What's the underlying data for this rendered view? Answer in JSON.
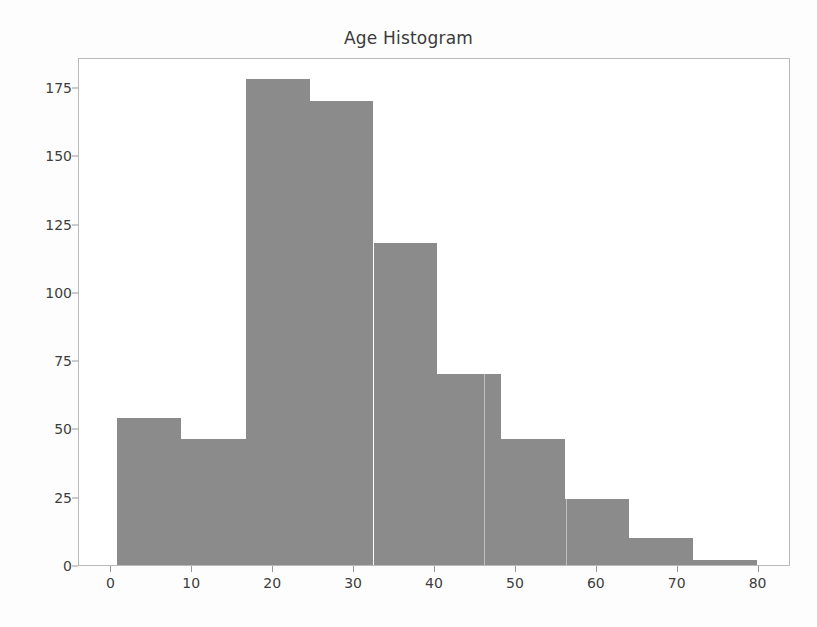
{
  "chart_data": {
    "type": "bar",
    "title": "Age Histogram",
    "xlabel": "",
    "ylabel": "",
    "grid": false,
    "legend": null,
    "xlim": [
      -4,
      84
    ],
    "ylim": [
      0,
      186
    ],
    "xticks": [
      0,
      10,
      20,
      30,
      40,
      50,
      60,
      70,
      80
    ],
    "yticks": [
      0,
      25,
      50,
      75,
      100,
      125,
      150,
      175
    ],
    "bin_edges": [
      0.7,
      8.6,
      16.6,
      24.5,
      32.4,
      40.3,
      48.2,
      56.1,
      64.0,
      71.9,
      79.8
    ],
    "categories": [
      "0.7-8.6",
      "8.6-16.6",
      "16.6-24.5",
      "24.5-32.4",
      "32.4-40.3",
      "40.3-48.2",
      "48.2-56.1",
      "56.1-64.0",
      "64.0-71.9",
      "71.9-79.8"
    ],
    "values": [
      54,
      46,
      178,
      170,
      118,
      70,
      46,
      24,
      10,
      2
    ],
    "bar_color": "#8b8b8b",
    "background_color": "#ffffff",
    "axes_edge_color": "#b9b9b9"
  },
  "figure": {
    "title": "Age Histogram"
  }
}
